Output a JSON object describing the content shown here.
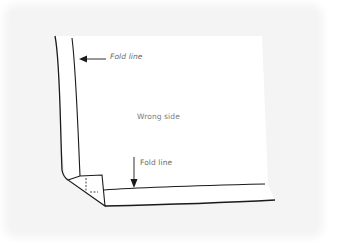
{
  "diagram": {
    "type": "sewing-hem-corner-illustration",
    "labels": {
      "fold_line_top": "Fold line",
      "wrong_side": "Wrong side",
      "fold_line_bottom": "Fold line"
    },
    "arrows": [
      {
        "name": "fold-line-arrow-left",
        "direction": "left",
        "points_to": "vertical fold line"
      },
      {
        "name": "fold-line-arrow-down",
        "direction": "down",
        "points_to": "horizontal fold line"
      }
    ],
    "colors": {
      "background": "#f4f4f4",
      "paper": "#ffffff",
      "ink": "#1a1a1a",
      "label_text": "#6a6a6a"
    }
  }
}
